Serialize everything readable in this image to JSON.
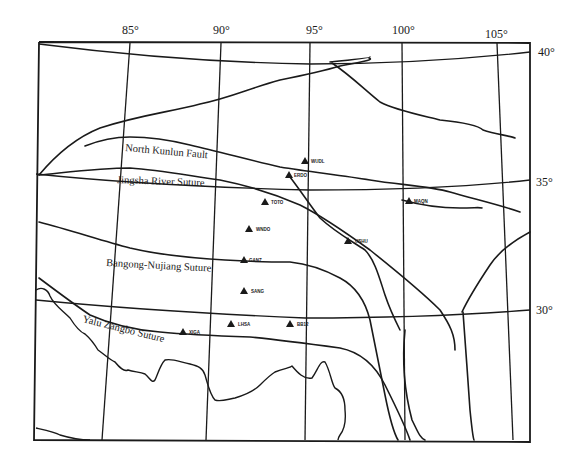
{
  "map": {
    "longitude_labels": [
      {
        "text": "85°",
        "x": 122,
        "y": 34
      },
      {
        "text": "90°",
        "x": 213,
        "y": 34
      },
      {
        "text": "95°",
        "x": 306,
        "y": 34
      },
      {
        "text": "100°",
        "x": 396,
        "y": 34
      },
      {
        "text": "105°",
        "x": 490,
        "y": 38
      }
    ],
    "latitude_labels": [
      {
        "text": "40°",
        "x": 538,
        "y": 56
      },
      {
        "text": "35°",
        "x": 536,
        "y": 186
      },
      {
        "text": "30°",
        "x": 536,
        "y": 314
      }
    ],
    "fault_labels": [
      {
        "text": "North Kunlun Fault",
        "x": 125,
        "y": 151,
        "rotate": 5
      },
      {
        "text": "Jingsha River Suture",
        "x": 117,
        "y": 183,
        "rotate": 2
      },
      {
        "text": "Bangong-Nujiang Suture",
        "x": 106,
        "y": 266,
        "rotate": 3
      },
      {
        "text": "Yalu Zangbo Suture",
        "x": 80,
        "y": 326,
        "rotate": 15
      }
    ],
    "stations": [
      {
        "label": "WUDL",
        "x": 305,
        "y": 162
      },
      {
        "label": "ERDO",
        "x": 289,
        "y": 175
      },
      {
        "label": "TOTO",
        "x": 265,
        "y": 203
      },
      {
        "label": "WNDO",
        "x": 249,
        "y": 229
      },
      {
        "label": "MAQN",
        "x": 408,
        "y": 202
      },
      {
        "label": "USHU",
        "x": 349,
        "y": 241
      },
      {
        "label": "GANZ",
        "x": 243,
        "y": 260
      },
      {
        "label": "SANG",
        "x": 244,
        "y": 292
      },
      {
        "label": "LHSA",
        "x": 231,
        "y": 325
      },
      {
        "label": "BB12",
        "x": 290,
        "y": 325
      },
      {
        "label": "XIGA",
        "x": 183,
        "y": 333
      }
    ],
    "colors": {
      "ink": "#1a1a1a",
      "paper": "#ffffff"
    }
  }
}
